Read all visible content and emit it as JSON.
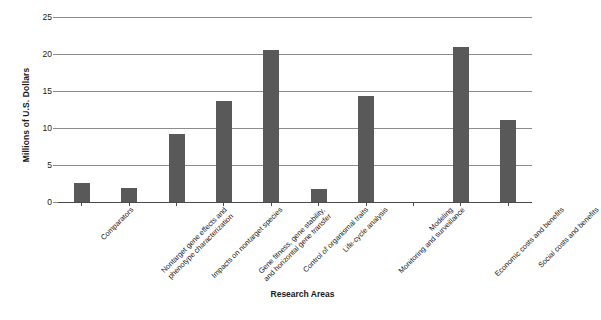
{
  "chart_data": {
    "type": "bar",
    "title": "",
    "xlabel": "Research Areas",
    "ylabel": "Millions of U.S. Dollars",
    "ylim": [
      0,
      25
    ],
    "yticks": [
      0,
      5,
      10,
      15,
      20,
      25
    ],
    "ytick_labels": [
      "0",
      "5",
      "10",
      "15",
      "20",
      "25"
    ],
    "grid": true,
    "legend": "none",
    "bar_color": "#595959",
    "categories": [
      "Comparators",
      "Nontarget gene effects and phenotype characterization",
      "Impacts on nontarget species",
      "Gene fitness, gene stability, and horizontal gene transfer",
      "Control of organismal traits",
      "Life-cycle analysis",
      "Monitoring and surveillance",
      "Modeling",
      "Economic costs and benefits",
      "Social costs and benefits"
    ],
    "category_lines": [
      [
        "Comparators"
      ],
      [
        "Nontarget gene effects and",
        "phenotype characterization"
      ],
      [
        "Impacts on nontarget species"
      ],
      [
        "Gene fitness, gene stability,",
        "and horizontal gene transfer"
      ],
      [
        "Control of organismal traits"
      ],
      [
        "Life-cycle analysis"
      ],
      [
        "Monitoring and surveillance"
      ],
      [
        "Modeling"
      ],
      [
        "Economic costs and benefits"
      ],
      [
        "Social costs and benefits"
      ]
    ],
    "values": [
      2.6,
      1.9,
      9.2,
      13.6,
      20.5,
      1.8,
      14.3,
      0,
      20.9,
      11.1
    ]
  }
}
